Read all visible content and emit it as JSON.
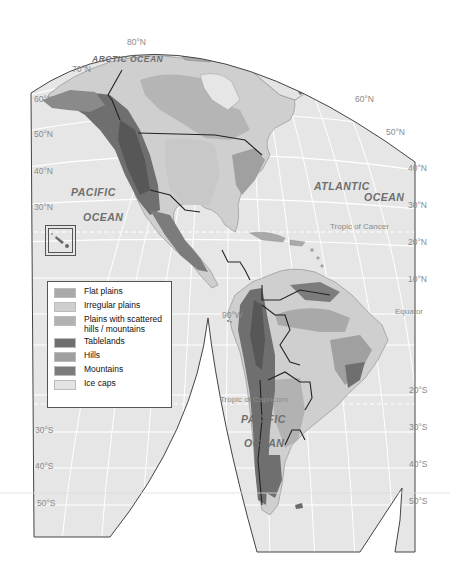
{
  "map": {
    "title": "Landforms of the Americas",
    "colors": {
      "ocean": "#e6e6e6",
      "graticule": "#ffffff",
      "outline": "#444444",
      "border": "#222222"
    },
    "ocean_labels": [
      {
        "text": "ARCTIC OCEAN",
        "name": "arctic-ocean-label"
      },
      {
        "text": "PACIFIC",
        "name": "pacific-ocean-north-label-1"
      },
      {
        "text": "OCEAN",
        "name": "pacific-ocean-north-label-2"
      },
      {
        "text": "ATLANTIC",
        "name": "atlantic-ocean-label-1"
      },
      {
        "text": "OCEAN",
        "name": "atlantic-ocean-label-2"
      },
      {
        "text": "PACIFIC",
        "name": "pacific-ocean-south-label-1"
      },
      {
        "text": "OCEAN",
        "name": "pacific-ocean-south-label-2"
      }
    ],
    "latitude_labels_left": [
      "80°N",
      "70°N",
      "60°N",
      "50°N",
      "40°N",
      "30°N",
      "30°S",
      "40°S",
      "50°S"
    ],
    "latitude_labels_right": [
      "60°N",
      "50°N",
      "40°N",
      "30°N",
      "20°N",
      "10°N",
      "20°S",
      "30°S",
      "40°S",
      "50°S"
    ],
    "longitude_labels": [
      "90°W"
    ],
    "special_lines": {
      "tropic_cancer": "Tropic of Cancer",
      "equator": "Equator",
      "tropic_capricorn": "Tropic of Capricorn"
    }
  },
  "legend": {
    "items": [
      {
        "label": "Flat plains",
        "color": "#a9a9a9"
      },
      {
        "label": "Irregular plains",
        "color": "#cfcfcf"
      },
      {
        "label": "Plains with scattered hills / mountains",
        "color": "#b2b2b2"
      },
      {
        "label": "Tablelands",
        "color": "#6f6f6f"
      },
      {
        "label": "Hills",
        "color": "#a0a0a0"
      },
      {
        "label": "Mountains",
        "color": "#7c7c7c"
      },
      {
        "label": "Ice caps",
        "color": "#e4e4e4"
      }
    ]
  }
}
